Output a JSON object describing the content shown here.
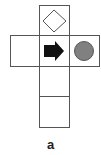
{
  "diagram": {
    "type": "cube-net",
    "label": "a",
    "faces": [
      {
        "id": "top",
        "symbol": "diamond-outline"
      },
      {
        "id": "left",
        "symbol": "none"
      },
      {
        "id": "center",
        "symbol": "black-arrow-right"
      },
      {
        "id": "right",
        "symbol": "gray-circle"
      },
      {
        "id": "bottom-1",
        "symbol": "none"
      },
      {
        "id": "bottom-2",
        "symbol": "none"
      }
    ],
    "colors": {
      "line": "#555555",
      "arrow": "#111111",
      "circle_fill": "#808080",
      "circle_stroke": "#555555"
    }
  }
}
